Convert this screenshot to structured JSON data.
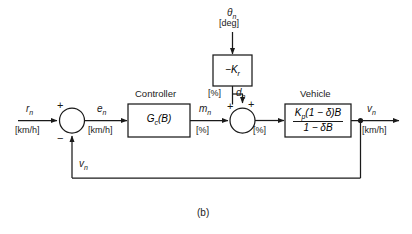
{
  "figure": {
    "caption": "(b)",
    "type": "control-system-block-diagram"
  },
  "signals": {
    "reference": {
      "name": "r",
      "subscript": "n",
      "unit": "[km/h]"
    },
    "error": {
      "name": "e",
      "subscript": "n",
      "unit": "[km/h]"
    },
    "control": {
      "name": "m",
      "subscript": "n",
      "unit": "[%]"
    },
    "disturbance_input": {
      "name": "θ",
      "subscript": "n",
      "unit": "[deg]"
    },
    "disturbance": {
      "name": "d",
      "subscript": "n",
      "unit": "[%]"
    },
    "plant_input_unit": "[%]",
    "output": {
      "name": "v",
      "subscript": "n",
      "unit": "[km/h]"
    },
    "feedback": {
      "name": "v",
      "subscript": "n"
    }
  },
  "blocks": {
    "controller": {
      "title": "Controller",
      "transfer_function": "G_c(B)",
      "tf_main": "G",
      "tf_sub": "c",
      "tf_arg": "(B)"
    },
    "grade": {
      "title": "",
      "transfer_function": "−K_r",
      "tf_main": "−K",
      "tf_sub": "r"
    },
    "vehicle": {
      "title": "Vehicle",
      "numerator": "K_p(1 − δ)B",
      "denominator": "1 − δB",
      "num_main": "K",
      "num_sub": "p",
      "num_rest": "(1 − δ)B",
      "den": "1 − δB"
    }
  },
  "summing_junctions": {
    "error_junction": {
      "plus": "+",
      "minus": "−"
    },
    "disturbance_junction": {
      "plus_left": "+",
      "plus_top": "+"
    }
  },
  "colors": {
    "line": "#1a1a1a",
    "text": "#1a1a1a",
    "background": "#ffffff"
  }
}
